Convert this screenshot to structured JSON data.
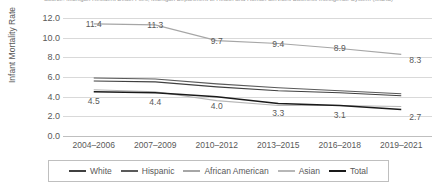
{
  "chart_data": {
    "type": "line",
    "title": "Source: Michigan Resident Death Files, Michigan Department of Health and Human Services Business Intelligence System (MIDIS)",
    "xlabel": "",
    "ylabel": "Infant Mortality Rate",
    "categories": [
      "2004–2006",
      "2007–2009",
      "2010–2012",
      "2013–2015",
      "2016–2018",
      "2019–2021"
    ],
    "ylim": [
      0.0,
      12.0
    ],
    "ytick_step": 2.0,
    "yticks": [
      "12.0",
      "10.0",
      "8.0",
      "6.0",
      "4.0",
      "2.0",
      "0.0"
    ],
    "grid": true,
    "legend_position": "bottom",
    "series": [
      {
        "name": "White",
        "color": "#404040",
        "labeled": false,
        "values": [
          5.6,
          5.5,
          5.0,
          4.6,
          4.4,
          4.1
        ]
      },
      {
        "name": "Hispanic",
        "color": "#5a5a5a",
        "labeled": false,
        "values": [
          5.9,
          5.8,
          5.3,
          4.9,
          4.6,
          4.3
        ]
      },
      {
        "name": "African American",
        "color": "#a6a6a6",
        "labeled": true,
        "values": [
          11.4,
          11.3,
          9.7,
          9.4,
          8.9,
          8.3
        ]
      },
      {
        "name": "Asian",
        "color": "#b7b7b7",
        "labeled": false,
        "values": [
          4.7,
          4.5,
          3.6,
          3.1,
          3.1,
          3.0
        ]
      },
      {
        "name": "Total",
        "color": "#1a1a1a",
        "labeled": true,
        "values": [
          4.5,
          4.4,
          4.0,
          3.3,
          3.1,
          2.7
        ]
      }
    ],
    "data_labels": {
      "African American": [
        "11.4",
        "11.3",
        "9.7",
        "9.4",
        "8.9",
        "8.3"
      ],
      "Total": [
        "4.5",
        "4.4",
        "4.0",
        "3.3",
        "3.1",
        "2.7"
      ]
    }
  },
  "legend": {
    "items": [
      {
        "label": "White",
        "color": "#404040"
      },
      {
        "label": "Hispanic",
        "color": "#5a5a5a"
      },
      {
        "label": "African American",
        "color": "#a6a6a6"
      },
      {
        "label": "Asian",
        "color": "#b7b7b7"
      },
      {
        "label": "Total",
        "color": "#1a1a1a"
      }
    ]
  }
}
